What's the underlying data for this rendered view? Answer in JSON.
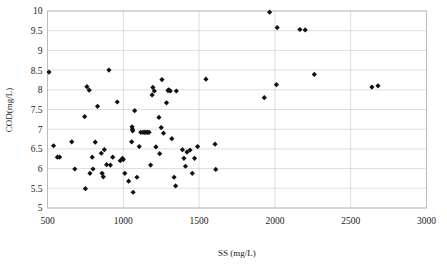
{
  "chart_data": {
    "type": "scatter",
    "title": "",
    "xlabel": "SS (mg/L)",
    "ylabel": "COD(mg/L)",
    "xlim": [
      500,
      3000
    ],
    "ylim": [
      5,
      10
    ],
    "xticks": [
      500,
      1000,
      1500,
      2000,
      2500,
      3000
    ],
    "xtick_labels": [
      "500",
      "1000",
      "1500",
      "2000",
      "2500",
      "3000"
    ],
    "yticks": [
      5,
      5.5,
      6,
      6.5,
      7,
      7.5,
      8,
      8.5,
      9,
      9.5,
      10
    ],
    "ytick_labels": [
      "5",
      "5.5",
      "6",
      "6.5",
      "7",
      "7.5",
      "8",
      "8.5",
      "9",
      "9.5",
      "10"
    ],
    "grid": true,
    "legend": "none",
    "marker": "diamond",
    "marker_color": "#111111",
    "series": [
      {
        "name": "COD vs SS",
        "points": [
          [
            510,
            8.45
          ],
          [
            540,
            6.58
          ],
          [
            565,
            6.29
          ],
          [
            580,
            6.29
          ],
          [
            660,
            6.68
          ],
          [
            680,
            5.99
          ],
          [
            745,
            7.32
          ],
          [
            750,
            5.49
          ],
          [
            760,
            8.08
          ],
          [
            775,
            7.99
          ],
          [
            780,
            5.88
          ],
          [
            795,
            6.29
          ],
          [
            800,
            5.99
          ],
          [
            815,
            6.67
          ],
          [
            830,
            7.58
          ],
          [
            855,
            6.39
          ],
          [
            860,
            5.88
          ],
          [
            868,
            5.79
          ],
          [
            875,
            6.48
          ],
          [
            890,
            6.1
          ],
          [
            905,
            8.5
          ],
          [
            915,
            6.09
          ],
          [
            930,
            6.29
          ],
          [
            960,
            7.69
          ],
          [
            980,
            6.2
          ],
          [
            995,
            6.26
          ],
          [
            1000,
            6.23
          ],
          [
            1010,
            5.88
          ],
          [
            1035,
            5.68
          ],
          [
            1055,
            6.68
          ],
          [
            1058,
            7.06
          ],
          [
            1060,
            7.0
          ],
          [
            1062,
            6.96
          ],
          [
            1065,
            5.4
          ],
          [
            1075,
            7.47
          ],
          [
            1090,
            5.78
          ],
          [
            1105,
            6.56
          ],
          [
            1115,
            6.92
          ],
          [
            1130,
            6.92
          ],
          [
            1140,
            6.92
          ],
          [
            1150,
            6.92
          ],
          [
            1160,
            6.92
          ],
          [
            1170,
            6.92
          ],
          [
            1180,
            6.09
          ],
          [
            1190,
            7.87
          ],
          [
            1195,
            8.06
          ],
          [
            1205,
            7.97
          ],
          [
            1215,
            6.55
          ],
          [
            1235,
            7.3
          ],
          [
            1240,
            6.38
          ],
          [
            1250,
            7.04
          ],
          [
            1255,
            8.26
          ],
          [
            1265,
            6.9
          ],
          [
            1285,
            7.67
          ],
          [
            1295,
            7.98
          ],
          [
            1300,
            8.0
          ],
          [
            1310,
            7.97
          ],
          [
            1320,
            6.76
          ],
          [
            1335,
            5.78
          ],
          [
            1345,
            5.56
          ],
          [
            1350,
            7.97
          ],
          [
            1390,
            6.48
          ],
          [
            1400,
            6.26
          ],
          [
            1410,
            6.06
          ],
          [
            1420,
            6.42
          ],
          [
            1440,
            6.47
          ],
          [
            1455,
            5.88
          ],
          [
            1470,
            6.26
          ],
          [
            1490,
            6.56
          ],
          [
            1545,
            8.27
          ],
          [
            1605,
            6.62
          ],
          [
            1610,
            5.98
          ],
          [
            1930,
            7.8
          ],
          [
            1965,
            9.97
          ],
          [
            2010,
            8.13
          ],
          [
            2015,
            9.58
          ],
          [
            2165,
            9.53
          ],
          [
            2200,
            9.52
          ],
          [
            2260,
            8.39
          ],
          [
            2640,
            8.07
          ],
          [
            2680,
            8.1
          ]
        ]
      }
    ]
  }
}
